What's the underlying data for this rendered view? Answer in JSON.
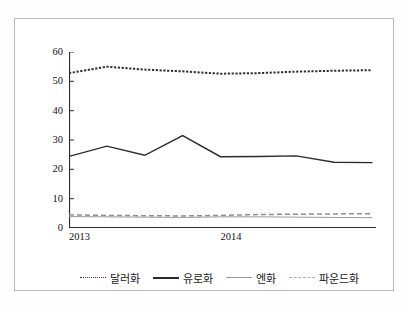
{
  "chart_data": {
    "type": "line",
    "title": "",
    "subtitle": "",
    "xlabel": "",
    "ylabel": "",
    "ylim": [
      0,
      60
    ],
    "yticks": [
      0,
      10,
      20,
      30,
      40,
      50,
      60
    ],
    "grid": false,
    "legend_position": "bottom",
    "x": [
      0,
      1,
      2,
      3,
      4,
      5,
      6,
      7,
      8
    ],
    "xtick_labels": [
      "2013",
      "",
      "",
      "",
      "2014",
      "",
      "",
      "",
      ""
    ],
    "x_axis_labels_shown": [
      "2013",
      "2014"
    ],
    "series": [
      {
        "name": "달러화",
        "style": "dotted",
        "color": "#2f2f2f",
        "values": [
          52.8,
          55.0,
          54.0,
          53.4,
          52.6,
          52.8,
          53.3,
          53.6,
          53.8
        ]
      },
      {
        "name": "유로화",
        "style": "solid",
        "color": "#2b2b2b",
        "values": [
          24.4,
          27.9,
          24.8,
          31.5,
          24.3,
          24.4,
          24.6,
          22.4,
          22.3
        ]
      },
      {
        "name": "엔화",
        "style": "thin-solid",
        "color": "#9a9a9a",
        "values": [
          3.9,
          3.8,
          3.7,
          3.6,
          3.8,
          3.8,
          3.7,
          3.6,
          3.5
        ]
      },
      {
        "name": "파운드화",
        "style": "dashed",
        "color": "#8f8f8f",
        "values": [
          4.5,
          4.3,
          4.2,
          4.1,
          4.3,
          4.6,
          4.7,
          4.8,
          4.9
        ]
      }
    ]
  },
  "axis": {
    "y_labels": [
      "60",
      "50",
      "40",
      "30",
      "20",
      "10",
      "0"
    ],
    "x_labels": [
      {
        "text": "2013",
        "pos": 0
      },
      {
        "text": "2014",
        "pos": 4
      }
    ]
  },
  "legend": {
    "items": [
      {
        "label": "달러화",
        "marker": "dotted"
      },
      {
        "label": "유로화",
        "marker": "solid"
      },
      {
        "label": "엔화",
        "marker": "thin-solid"
      },
      {
        "label": "파운드화",
        "marker": "dashed"
      }
    ]
  }
}
